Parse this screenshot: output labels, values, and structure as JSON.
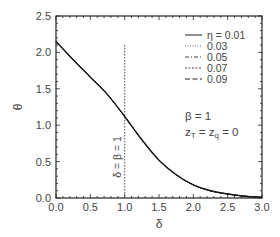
{
  "chart_data": {
    "type": "line",
    "title": "",
    "xlabel": "δ",
    "ylabel": "θ",
    "xlim": [
      0.0,
      3.0
    ],
    "ylim": [
      0.0,
      2.5
    ],
    "xticks": [
      "0.0",
      "0.5",
      "1.0",
      "1.5",
      "2.0",
      "2.5",
      "3.0"
    ],
    "yticks": [
      "0.0",
      "0.5",
      "1.0",
      "1.5",
      "2.0",
      "2.5"
    ],
    "grid": false,
    "legend_position": "upper right",
    "legend_title": "η",
    "series": [
      {
        "name": "η = 0.01",
        "style": "solid",
        "x": [
          0.0,
          0.25,
          0.5,
          0.75,
          1.0,
          1.25,
          1.5,
          1.75,
          2.0,
          2.25,
          2.5,
          2.75,
          3.0
        ],
        "y": [
          2.15,
          1.9,
          1.66,
          1.42,
          1.12,
          0.8,
          0.52,
          0.32,
          0.18,
          0.1,
          0.055,
          0.025,
          0.01
        ]
      },
      {
        "name": "0.03",
        "style": "dotted",
        "x": [
          0.0,
          0.25,
          0.5,
          0.75,
          1.0,
          1.25,
          1.5,
          1.75,
          2.0,
          2.25,
          2.5,
          2.75,
          3.0
        ],
        "y": [
          2.15,
          1.9,
          1.66,
          1.42,
          1.12,
          0.8,
          0.52,
          0.32,
          0.18,
          0.1,
          0.055,
          0.025,
          0.01
        ]
      },
      {
        "name": "0.05",
        "style": "dash-dot",
        "x": [
          0.0,
          0.25,
          0.5,
          0.75,
          1.0,
          1.25,
          1.5,
          1.75,
          2.0,
          2.25,
          2.5,
          2.75,
          3.0
        ],
        "y": [
          2.15,
          1.9,
          1.66,
          1.42,
          1.12,
          0.8,
          0.52,
          0.32,
          0.18,
          0.1,
          0.055,
          0.025,
          0.01
        ]
      },
      {
        "name": "0.07",
        "style": "short-dash",
        "x": [
          0.0,
          0.25,
          0.5,
          0.75,
          1.0,
          1.25,
          1.5,
          1.75,
          2.0,
          2.25,
          2.5,
          2.75,
          3.0
        ],
        "y": [
          2.15,
          1.9,
          1.66,
          1.42,
          1.12,
          0.8,
          0.52,
          0.32,
          0.18,
          0.1,
          0.055,
          0.025,
          0.01
        ]
      },
      {
        "name": "0.09",
        "style": "long-dash",
        "x": [
          0.0,
          0.25,
          0.5,
          0.75,
          1.0,
          1.25,
          1.5,
          1.75,
          2.0,
          2.25,
          2.5,
          2.75,
          3.0
        ],
        "y": [
          2.15,
          1.9,
          1.66,
          1.42,
          1.12,
          0.8,
          0.52,
          0.32,
          0.18,
          0.1,
          0.055,
          0.025,
          0.01
        ]
      }
    ],
    "reference_line": {
      "x": 1.0,
      "y_range": [
        0.0,
        2.1
      ],
      "style": "dotted",
      "label": "δ = β = 1"
    },
    "annotations": [
      "β = 1",
      "zT = zq = 0"
    ]
  },
  "legend": {
    "items": [
      "η = 0.01",
      "0.03",
      "0.05",
      "0.07",
      "0.09"
    ]
  },
  "annotations": {
    "beta": "β = 1",
    "z_prefix": "z",
    "z_sub_t": "T",
    "z_mid": " = z",
    "z_sub_q": "q",
    "z_suffix": " = 0",
    "vline_label": "δ = β = 1"
  },
  "axes": {
    "xlabel": "δ",
    "ylabel": "θ",
    "xticks": [
      "0.0",
      "0.5",
      "1.0",
      "1.5",
      "2.0",
      "2.5",
      "3.0"
    ],
    "yticks": [
      "0.0",
      "0.5",
      "1.0",
      "1.5",
      "2.0",
      "2.5"
    ]
  }
}
